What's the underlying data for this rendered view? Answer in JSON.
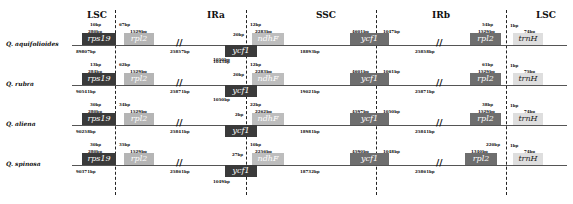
{
  "regions": [
    "LSC",
    "IRa",
    "SSC",
    "IRb",
    "LSC"
  ],
  "tracks": [
    {
      "species": "Q. aquifolioides",
      "lsc_length": "89807bp",
      "ira_length": "25857bp",
      "ssc_length": "18893bp",
      "irb_length": "25858bp",
      "rps19_len": "280bp",
      "rps19_overhang": "10bp",
      "rpl2_gap": "67bp",
      "rpl2_len": "1529bp",
      "ycf1_ira_len": "1043bp",
      "ycf1_ira_overhang": "20bp",
      "ndhF_gap": "12bp",
      "ndhF_len": "2283bp",
      "ycf1_irb_left": "4601bp",
      "ycf1_irb_right": "1047bp",
      "rpl2_b_len": "1529bp",
      "rpl2_b_gap": "54bp",
      "trnH_gap": "1bp",
      "trnH_len": "74bp"
    },
    {
      "species": "Q. rubra",
      "lsc_length": "90541bp",
      "ira_length": "25871bp",
      "ssc_length": "19021bp",
      "irb_length": "25871bp",
      "rps19_len": "284bp",
      "rps19_overhang": "13bp",
      "rpl2_gap": "62bp",
      "rpl2_len": "1529bp",
      "ycf1_ira_len": "1050bp",
      "ycf1_ira_overhang": "20bp",
      "ndhF_gap": "12bp",
      "ndhF_len": "2283bp",
      "ycf1_irb_left": "4601bp",
      "ycf1_irb_right": "1061bp",
      "rpl2_b_len": "1529bp",
      "rpl2_b_gap": "61bp",
      "trnH_gap": "1bp",
      "trnH_len": "75bp"
    },
    {
      "species": "Q. aliena",
      "lsc_length": "90258bp",
      "ira_length": "25841bp",
      "ssc_length": "18981bp",
      "irb_length": "25841bp",
      "rps19_len": "280bp",
      "rps19_overhang": "30bp",
      "rpl2_gap": "34bp",
      "rpl2_len": "1529bp",
      "ycf1_ira_len": "1050bp",
      "ycf1_ira_overhang": "2bp",
      "ndhF_gap": "22bp",
      "ndhF_len": "2262bp",
      "ycf1_irb_left": "4597bp",
      "ycf1_irb_right": "1050bp",
      "rpl2_b_len": "1529bp",
      "rpl2_b_gap": "38bp",
      "trnH_gap": "1bp",
      "trnH_len": "74bp"
    },
    {
      "species": "Q. spinosa",
      "lsc_length": "90371bp",
      "ira_length": "25861bp",
      "ssc_length": "18732bp",
      "irb_length": "25861bp",
      "rps19_len": "280bp",
      "rps19_overhang": "30bp",
      "rpl2_gap": "35bp",
      "rpl2_len": "1529bp",
      "ycf1_ira_len": "1049bp",
      "ycf1_ira_overhang": "27bp",
      "ndhF_gap": "10bp",
      "ndhF_len": "2256bp",
      "ycf1_irb_left": "4590bp",
      "ycf1_irb_right": "1048bp",
      "rpl2_b_len": "1340bp",
      "rpl2_b_gap": "220bp",
      "trnH_gap": "1bp",
      "trnH_len": "74bp"
    }
  ],
  "gene_names": {
    "rps19": "rps19",
    "rpl2": "rpl2",
    "ycf1": "ycf1",
    "ndhF": "ndhF",
    "trnH": "trnH"
  }
}
